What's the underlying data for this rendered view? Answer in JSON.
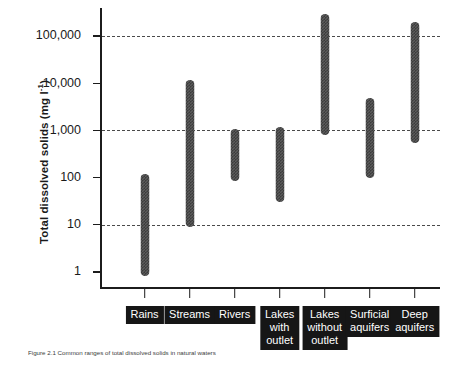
{
  "chart_data": {
    "type": "bar",
    "title": "",
    "xlabel": "",
    "ylabel": "Total dissolved solids (mg l⁻¹)",
    "ylabel_text": "Total dissolved solids  (mg l",
    "ylabel_exponent": "-1",
    "ylabel_close": ")",
    "yscale": "log",
    "ylim": [
      0.5,
      400000
    ],
    "grid": "horizontal dashed at 10, 1,000 and 100,000",
    "legend": "none",
    "orientation": "vertical range bars (min-max)",
    "ytick_values": [
      1,
      10,
      100,
      1000,
      10000,
      100000
    ],
    "ytick_labels": [
      "1",
      "10",
      "100",
      "1,000",
      "10,000",
      "100,000"
    ],
    "gridline_values": [
      10,
      1000,
      100000
    ],
    "categories": [
      "Rains",
      "Streams",
      "Rivers",
      "Lakes with outlet",
      "Lakes without outlet",
      "Surficial aquifers",
      "Deep aquifers"
    ],
    "category_labels": [
      "Rains",
      "Streams",
      "Rivers",
      "Lakes\nwith\noutlet",
      "Lakes\nwithout\noutlet",
      "Surficial\naquifers",
      "Deep\naquifers"
    ],
    "series": [
      {
        "name": "minimum",
        "values": [
          0.8,
          9,
          85,
          30,
          800,
          100,
          550
        ]
      },
      {
        "name": "maximum",
        "values": [
          120,
          12000,
          1100,
          1200,
          300000,
          5000,
          200000
        ]
      }
    ],
    "ranges": [
      {
        "category": "Rains",
        "min": 0.8,
        "max": 120
      },
      {
        "category": "Streams",
        "min": 9,
        "max": 12000
      },
      {
        "category": "Rivers",
        "min": 85,
        "max": 1100
      },
      {
        "category": "Lakes with outlet",
        "min": 30,
        "max": 1200
      },
      {
        "category": "Lakes without outlet",
        "min": 800,
        "max": 300000
      },
      {
        "category": "Surficial aquifers",
        "min": 100,
        "max": 5000
      },
      {
        "category": "Deep aquifers",
        "min": 550,
        "max": 200000
      }
    ],
    "bar_color": "#5c5c5c",
    "axis_color": "#1c1c1c",
    "grid_color": "#4a4a4a",
    "category_box_color": "#161616",
    "category_text_color": "#ffffff"
  },
  "caption": {
    "text": "Figure 2.1 Common ranges of total dissolved solids in natural waters"
  }
}
